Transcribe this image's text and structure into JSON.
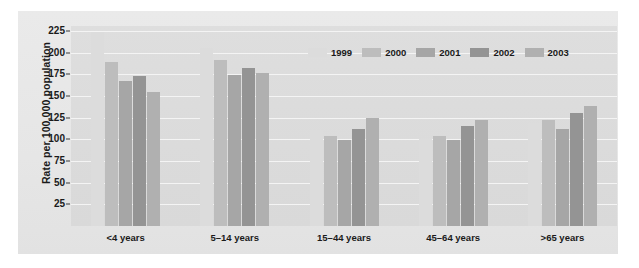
{
  "chart_data": {
    "type": "bar",
    "title": "",
    "xlabel": "",
    "ylabel": "Rate per 100,000 population",
    "ylim": [
      0,
      231
    ],
    "yticks": [
      25,
      50,
      75,
      100,
      125,
      150,
      175,
      200,
      225
    ],
    "ytick_labels": [
      "25",
      "50",
      "75",
      "100",
      "125",
      "150",
      "175",
      "200",
      "225"
    ],
    "grid": true,
    "legend_position": "top-right",
    "categories": [
      "<4 years",
      "5–14 years",
      "15–44 years",
      "45–64 years",
      ">65 years"
    ],
    "series": [
      {
        "name": "1999",
        "color": "#dcdcdc",
        "values": [
          224,
          206,
          111,
          101,
          119
        ]
      },
      {
        "name": "2000",
        "color": "#bdbdbd",
        "values": [
          190,
          192,
          104,
          104,
          122
        ]
      },
      {
        "name": "2001",
        "color": "#a6a6a6",
        "values": [
          168,
          175,
          99,
          99,
          112
        ]
      },
      {
        "name": "2002",
        "color": "#949494",
        "values": [
          173,
          182,
          112,
          116,
          131
        ]
      },
      {
        "name": "2003",
        "color": "#b0b0b0",
        "values": [
          155,
          177,
          125,
          123,
          139
        ]
      }
    ]
  },
  "colors": {
    "figure_background": "#ffffff",
    "panel_background": "#e9e9e9",
    "plot_background": "#dcdcdc",
    "gridline": "#f4f4f4",
    "text": "#1a1a1a"
  }
}
